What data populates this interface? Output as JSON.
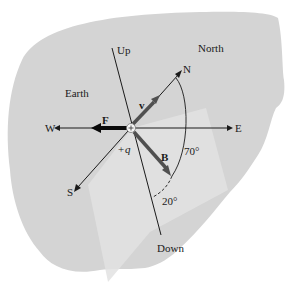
{
  "diagram": {
    "region_label": "Earth",
    "north_label": "North",
    "axes": {
      "up": "Up",
      "down": "Down",
      "north": "N",
      "south": "S",
      "east": "E",
      "west": "W"
    },
    "vectors": {
      "force": "F",
      "velocity": "v",
      "magnetic_field": "B"
    },
    "charge": {
      "sign": "+",
      "label": "q"
    },
    "angles": {
      "b_from_north": "70°",
      "b_from_down": "20°"
    },
    "colors": {
      "background": "#ffffff",
      "earth_shape": "#d4d4d4",
      "plane": "#e2e2e2",
      "line": "#1a1a1a",
      "vector_gray": "#505050",
      "force_black": "#0a0a0a"
    }
  }
}
